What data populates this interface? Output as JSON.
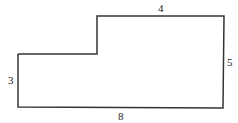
{
  "figure": {
    "type": "L-shaped polygon",
    "stroke_color": "#333333",
    "labels": {
      "top": "4",
      "right": "5",
      "left": "3",
      "bottom": "8"
    }
  }
}
